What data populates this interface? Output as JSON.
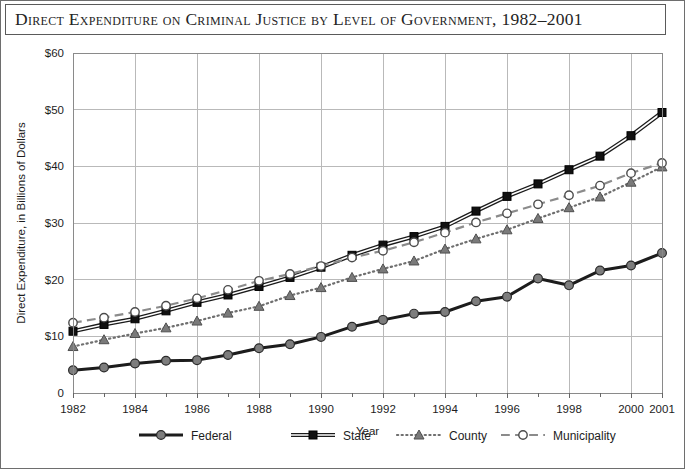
{
  "figure": {
    "title": "Direct Expenditure on Criminal Justice by Level of Government, 1982–2001"
  },
  "chart_data": {
    "type": "line",
    "title": "Direct Expenditure on Criminal Justice by Level of Government, 1982–2001",
    "xlabel": "Year",
    "ylabel": "Direct Expenditure, in Billions of Dollars",
    "x": [
      1982,
      1983,
      1984,
      1985,
      1986,
      1987,
      1988,
      1989,
      1990,
      1991,
      1992,
      1993,
      1994,
      1995,
      1996,
      1997,
      1998,
      1999,
      2000,
      2001
    ],
    "xlim": [
      1982,
      2001
    ],
    "ylim": [
      0,
      60
    ],
    "xticks": [
      1982,
      1984,
      1986,
      1988,
      1990,
      1992,
      1994,
      1996,
      1998,
      2000,
      2001
    ],
    "xticklabels": [
      "1982",
      "1984",
      "1986",
      "1988",
      "1990",
      "1992",
      "1994",
      "1996",
      "1998",
      "2000",
      "2001"
    ],
    "xminorticks": [
      1983,
      1985,
      1987,
      1989,
      1991,
      1993,
      1995,
      1997,
      1999
    ],
    "yticks": [
      0,
      10,
      20,
      30,
      40,
      50,
      60
    ],
    "yticklabels": [
      "0",
      "$10",
      "$20",
      "$30",
      "$40",
      "$50",
      "$60"
    ],
    "grid": true,
    "grid_axis": "both",
    "legend_position": "bottom",
    "series": [
      {
        "name": "Federal",
        "values": [
          4.0,
          4.5,
          5.2,
          5.7,
          5.8,
          6.7,
          7.9,
          8.6,
          9.9,
          11.7,
          12.9,
          14.0,
          14.3,
          16.2,
          17.0,
          20.2,
          19.0,
          21.6,
          22.5,
          24.7
        ],
        "line_style": "solid",
        "line_width": 3,
        "marker": "circle-filled",
        "color": "#1c1c1c",
        "marker_fill": "#7d7d7d"
      },
      {
        "name": "State",
        "values": [
          10.9,
          12.1,
          13.1,
          14.5,
          16.0,
          17.3,
          18.8,
          20.4,
          22.2,
          24.3,
          26.1,
          27.6,
          29.4,
          32.1,
          34.7,
          36.9,
          39.4,
          41.8,
          45.4,
          49.5
        ],
        "line_style": "solid",
        "line_width": 1.6,
        "marker": "square-filled",
        "color": "#1c1c1c",
        "marker_fill": "#111111"
      },
      {
        "name": "County",
        "values": [
          8.2,
          9.4,
          10.5,
          11.5,
          12.7,
          14.1,
          15.3,
          17.2,
          18.6,
          20.4,
          21.9,
          23.3,
          25.4,
          27.2,
          28.8,
          30.8,
          32.7,
          34.6,
          37.2,
          39.9
        ],
        "line_style": "dotted",
        "line_width": 2.2,
        "marker": "triangle-filled",
        "color": "#6f6f6f",
        "marker_fill": "#7a7a7a"
      },
      {
        "name": "Municipality",
        "values": [
          12.4,
          13.3,
          14.3,
          15.4,
          16.7,
          18.2,
          19.8,
          21.0,
          22.4,
          23.9,
          25.1,
          26.6,
          28.3,
          30.1,
          31.7,
          33.3,
          34.9,
          36.6,
          38.8,
          40.6
        ],
        "line_style": "dashed",
        "line_width": 2.2,
        "marker": "circle-open",
        "color": "#8b8b8b",
        "marker_fill": "#ffffff"
      }
    ]
  },
  "legend": {
    "items": [
      {
        "label": "Federal"
      },
      {
        "label": "State"
      },
      {
        "label": "County"
      },
      {
        "label": "Municipality"
      }
    ]
  },
  "colors": {
    "frame": "#6e6e6e",
    "grid": "#b9b9b9",
    "text": "#1d1d1d",
    "background": "#ffffff"
  }
}
